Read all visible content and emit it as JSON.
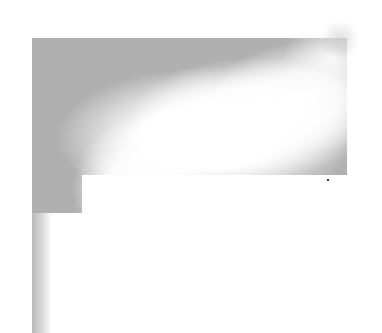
{
  "figure": {
    "colors": {
      "background": "#ffffff",
      "shade": "#b0b0b0",
      "highlight": "#ffffff"
    }
  }
}
